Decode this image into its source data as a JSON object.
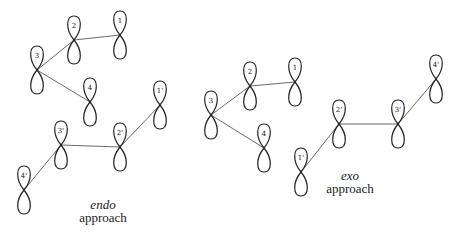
{
  "diagrams": [
    {
      "id": "endo",
      "caption_italic": "endo",
      "caption": "approach",
      "nodes": [
        {
          "label": "1",
          "x": 120,
          "y": 35
        },
        {
          "label": "2",
          "x": 74,
          "y": 40
        },
        {
          "label": "3",
          "x": 37,
          "y": 70
        },
        {
          "label": "4",
          "x": 90,
          "y": 102
        },
        {
          "label": "1'",
          "x": 160,
          "y": 105
        },
        {
          "label": "2'",
          "x": 120,
          "y": 147
        },
        {
          "label": "3'",
          "x": 61,
          "y": 145
        },
        {
          "label": "4'",
          "x": 24,
          "y": 190
        }
      ],
      "bonds": [
        [
          "1",
          "2"
        ],
        [
          "2",
          "3"
        ],
        [
          "3",
          "4"
        ],
        [
          "1'",
          "2'"
        ],
        [
          "2'",
          "3'"
        ],
        [
          "3'",
          "4'"
        ]
      ]
    },
    {
      "id": "exo",
      "caption_italic": "exo",
      "caption": "approach",
      "nodes": [
        {
          "label": "1",
          "x": 295,
          "y": 82
        },
        {
          "label": "2",
          "x": 250,
          "y": 86
        },
        {
          "label": "3",
          "x": 211,
          "y": 115
        },
        {
          "label": "4",
          "x": 264,
          "y": 148
        },
        {
          "label": "1'",
          "x": 301,
          "y": 172
        },
        {
          "label": "2'",
          "x": 339,
          "y": 124
        },
        {
          "label": "3'",
          "x": 398,
          "y": 124
        },
        {
          "label": "4'",
          "x": 436,
          "y": 79
        }
      ],
      "bonds": [
        [
          "1",
          "2"
        ],
        [
          "2",
          "3"
        ],
        [
          "3",
          "4"
        ],
        [
          "1'",
          "2'"
        ],
        [
          "2'",
          "3'"
        ],
        [
          "3'",
          "4'"
        ]
      ]
    }
  ]
}
